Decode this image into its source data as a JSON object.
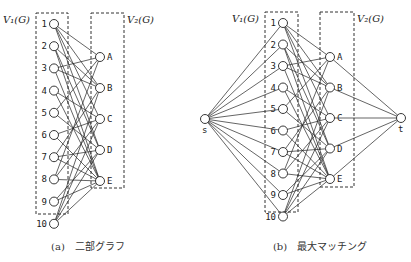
{
  "figures": [
    {
      "id": "a",
      "caption": "(a)　二部グラフ",
      "set_labels": {
        "left": "V₁(G)",
        "right": "V₂(G)"
      },
      "left_nodes": [
        "1",
        "2",
        "3",
        "4",
        "5",
        "6",
        "7",
        "8",
        "9",
        "10"
      ],
      "right_nodes": [
        "A",
        "B",
        "C",
        "D",
        "E"
      ],
      "edges": [
        [
          "1",
          "A"
        ],
        [
          "1",
          "B"
        ],
        [
          "1",
          "C"
        ],
        [
          "1",
          "D"
        ],
        [
          "2",
          "B"
        ],
        [
          "2",
          "D"
        ],
        [
          "2",
          "E"
        ],
        [
          "3",
          "A"
        ],
        [
          "3",
          "B"
        ],
        [
          "3",
          "E"
        ],
        [
          "4",
          "C"
        ],
        [
          "4",
          "E"
        ],
        [
          "5",
          "A"
        ],
        [
          "5",
          "D"
        ],
        [
          "6",
          "C"
        ],
        [
          "6",
          "E"
        ],
        [
          "7",
          "B"
        ],
        [
          "7",
          "D"
        ],
        [
          "7",
          "E"
        ],
        [
          "8",
          "A"
        ],
        [
          "8",
          "C"
        ],
        [
          "8",
          "E"
        ],
        [
          "9",
          "D"
        ],
        [
          "9",
          "E"
        ],
        [
          "10",
          "B"
        ],
        [
          "10",
          "C"
        ],
        [
          "10",
          "D"
        ],
        [
          "10",
          "E"
        ]
      ]
    },
    {
      "id": "b",
      "caption": "(b)　最大マッチング",
      "set_labels": {
        "left": "V₁(G)",
        "right": "V₂(G)"
      },
      "source": "s",
      "sink": "t",
      "left_nodes": [
        "1",
        "2",
        "3",
        "4",
        "5",
        "6",
        "7",
        "8",
        "9",
        "10"
      ],
      "right_nodes": [
        "A",
        "B",
        "C",
        "D",
        "E"
      ]
    }
  ]
}
